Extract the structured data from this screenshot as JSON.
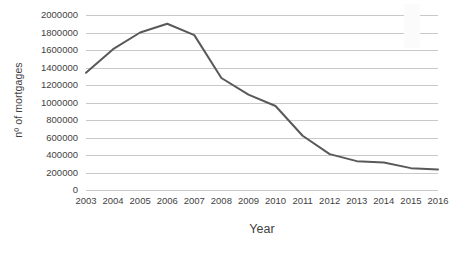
{
  "chart_data": {
    "type": "line",
    "title": "",
    "xlabel": "Year",
    "ylabel": "nº of mortgages",
    "categories": [
      "2003",
      "2004",
      "2005",
      "2006",
      "2007",
      "2008",
      "2009",
      "2010",
      "2011",
      "2012",
      "2013",
      "2014",
      "2015",
      "2016"
    ],
    "x": [
      2003,
      2004,
      2005,
      2006,
      2007,
      2008,
      2009,
      2010,
      2011,
      2012,
      2013,
      2014,
      2015,
      2016
    ],
    "series": [
      {
        "name": "nº of mortgages",
        "values": [
          1340000,
          1610000,
          1800000,
          1900000,
          1770000,
          1280000,
          1090000,
          960000,
          620000,
          410000,
          330000,
          315000,
          250000,
          235000
        ],
        "color": "#595959",
        "line_width": 2
      }
    ],
    "ylim": [
      0,
      2000000
    ],
    "ytick_step": 200000,
    "yticks": [
      0,
      200000,
      400000,
      600000,
      800000,
      1000000,
      1200000,
      1400000,
      1600000,
      1800000,
      2000000
    ],
    "ytick_labels": [
      "0",
      "200000",
      "400000",
      "600000",
      "800000",
      "1000000",
      "1200000",
      "1400000",
      "1600000",
      "1800000",
      "2000000"
    ],
    "grid": true,
    "grid_color": "#c9c9c9",
    "legend": false,
    "legend_position": "none",
    "background": "#ffffff",
    "text_color": "#3f3f3f"
  }
}
